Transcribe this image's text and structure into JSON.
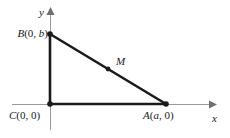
{
  "figure": {
    "background_color": "#ffffff",
    "axis_color": "#9a9a9a",
    "triangle_color": "#1a1a1a",
    "point_color": "#1a1a1a",
    "label_color": "#1a1a1a"
  },
  "axes": {
    "x_axis_label": "x",
    "y_axis_label": "y",
    "x_axis_name": "x-axis",
    "y_axis_name": "y-axis"
  },
  "points": {
    "B": {
      "label": "B(0, b)",
      "name_text": "B",
      "coords_text": "(0, b)",
      "x": 50,
      "y": 34
    },
    "C": {
      "label": "C(0, 0)",
      "name_text": "C",
      "coords_text": "(0, 0)",
      "x": 50,
      "y": 104
    },
    "A": {
      "label": "A(a, 0)",
      "name_text": "A",
      "coords_text": "(a, 0)",
      "x": 166,
      "y": 104
    },
    "M": {
      "label": "M",
      "name_text": "M",
      "coords_text": "",
      "x": 108,
      "y": 69
    }
  },
  "chart_data": {
    "type": "scatter",
    "title": "",
    "xlabel": "x",
    "ylabel": "y",
    "grid": false,
    "legend": null,
    "annotations": [
      "B(0, b)",
      "C(0, 0)",
      "A(a, 0)",
      "M"
    ],
    "series": [
      {
        "name": "triangle-vertices",
        "points": [
          {
            "label": "B(0, b)",
            "px": 50,
            "py": 34
          },
          {
            "label": "C(0, 0)",
            "px": 50,
            "py": 104
          },
          {
            "label": "A(a, 0)",
            "px": 166,
            "py": 104
          }
        ]
      },
      {
        "name": "midpoint",
        "points": [
          {
            "label": "M",
            "px": 108,
            "py": 69
          }
        ]
      }
    ],
    "segments": [
      {
        "name": "leg-CB",
        "from": "C(0, 0)",
        "to": "B(0, b)"
      },
      {
        "name": "leg-CA",
        "from": "C(0, 0)",
        "to": "A(a, 0)"
      },
      {
        "name": "hypotenuse-BA",
        "from": "B(0, b)",
        "to": "A(a, 0)"
      }
    ]
  }
}
